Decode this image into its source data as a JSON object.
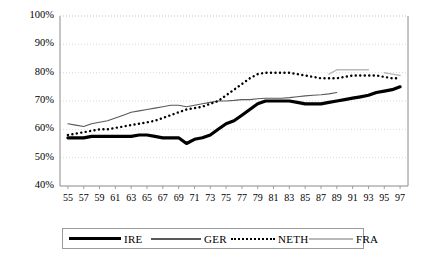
{
  "chart_data": {
    "type": "line",
    "title": "",
    "xlabel": "",
    "ylabel": "",
    "ylim": [
      40,
      100
    ],
    "ytick_labels": [
      "100%",
      "90%",
      "80%",
      "70%",
      "60%",
      "50%",
      "40%"
    ],
    "ytick_values": [
      100,
      90,
      80,
      70,
      60,
      50,
      40
    ],
    "grid": true,
    "legend_position": "bottom",
    "x": [
      55,
      56,
      57,
      58,
      59,
      60,
      61,
      62,
      63,
      64,
      65,
      66,
      67,
      68,
      69,
      70,
      71,
      72,
      73,
      74,
      75,
      76,
      77,
      78,
      79,
      80,
      81,
      82,
      83,
      84,
      85,
      86,
      87,
      88,
      89,
      90,
      91,
      92,
      93,
      94,
      95,
      96,
      97
    ],
    "xtick_labels": [
      "55",
      "57",
      "59",
      "61",
      "63",
      "65",
      "67",
      "69",
      "71",
      "73",
      "75",
      "77",
      "79",
      "81",
      "83",
      "85",
      "87",
      "89",
      "91",
      "93",
      "95",
      "97"
    ],
    "series": [
      {
        "name": "IRE",
        "style": "solid-thick-black",
        "color": "#000000",
        "width": 3.2,
        "values": [
          57,
          57,
          57,
          57.5,
          57.5,
          57.5,
          57.5,
          57.5,
          57.5,
          58,
          58,
          57.5,
          57,
          57,
          57,
          55,
          56.5,
          57,
          58,
          60,
          62,
          63,
          65,
          67,
          69,
          70,
          70,
          70,
          70,
          69.5,
          69,
          69,
          69,
          69.5,
          70,
          70.5,
          71,
          71.5,
          72,
          73,
          73.5,
          74,
          75
        ]
      },
      {
        "name": "GER",
        "style": "solid-thin-gray",
        "color": "#5a5a5a",
        "width": 1.1,
        "values": [
          62,
          61.5,
          61,
          62,
          62.5,
          63,
          64,
          65,
          66,
          66.5,
          67,
          67.5,
          68,
          68.5,
          68.5,
          68,
          68.5,
          69,
          69.5,
          70,
          70,
          70.2,
          70.5,
          70.5,
          70.8,
          71,
          71,
          71,
          71.2,
          71.5,
          71.8,
          72,
          72.2,
          72.5,
          73,
          null,
          null,
          null,
          null,
          null,
          null,
          null,
          null
        ]
      },
      {
        "name": "NETH",
        "style": "dotted-black",
        "color": "#000000",
        "width": 2.4,
        "values": [
          58,
          58.5,
          59,
          59.5,
          60,
          60,
          60.5,
          61,
          61.5,
          62,
          62.5,
          63,
          64,
          65,
          66,
          67,
          67.5,
          68,
          69,
          70,
          72,
          74,
          76,
          78,
          79.5,
          80,
          80,
          80,
          80,
          79.5,
          79,
          78.5,
          78,
          78,
          78,
          78.5,
          79,
          79,
          79,
          79,
          78.5,
          78,
          78
        ]
      },
      {
        "name": "FRA",
        "style": "solid-thin-light",
        "color": "#b9b9b9",
        "width": 1.4,
        "values": [
          null,
          null,
          null,
          null,
          null,
          null,
          null,
          null,
          null,
          null,
          null,
          null,
          null,
          null,
          null,
          null,
          null,
          null,
          null,
          null,
          null,
          null,
          null,
          null,
          null,
          null,
          null,
          null,
          null,
          null,
          null,
          null,
          null,
          79.5,
          81,
          81,
          81,
          81,
          81,
          null,
          80,
          79.5,
          79
        ]
      }
    ]
  },
  "legend": {
    "items": [
      {
        "label": "IRE"
      },
      {
        "label": "GER"
      },
      {
        "label": "NETH"
      },
      {
        "label": "FRA"
      }
    ]
  }
}
